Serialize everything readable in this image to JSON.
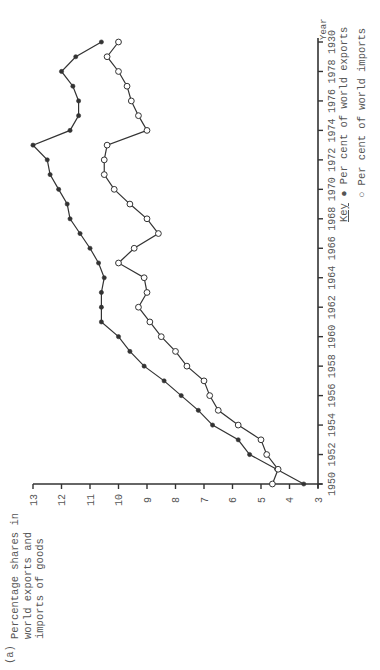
{
  "figure": {
    "panel_label": "(a)",
    "title_lines": [
      "Percentage shares in",
      "world exports and",
      "imports of goods"
    ]
  },
  "legend": {
    "key_word": "Key",
    "exports_marker": "●",
    "exports_label": "Per cent of world exports",
    "imports_marker": "○",
    "imports_label": "Per cent of world imports"
  },
  "axes": {
    "x_title": "Year",
    "x_ticks": [
      "1950",
      "1952",
      "1954",
      "1956",
      "1958",
      "1960",
      "1962",
      "1964",
      "1966",
      "1968",
      "1970",
      "1972",
      "1974",
      "1976",
      "1978",
      "1930"
    ],
    "y_ticks": [
      "3",
      "4",
      "5",
      "6",
      "7",
      "8",
      "9",
      "10",
      "11",
      "12",
      "13"
    ]
  },
  "colors": {
    "line": "#333333",
    "axis": "#333333",
    "text": "#555555"
  },
  "chart_data": {
    "type": "line",
    "title": "Percentage shares in world exports and imports of goods",
    "panel": "(a)",
    "xlabel": "Year",
    "ylabel": "Percentage share",
    "x": [
      1950,
      1951,
      1952,
      1953,
      1954,
      1955,
      1956,
      1957,
      1958,
      1959,
      1960,
      1961,
      1962,
      1963,
      1964,
      1965,
      1966,
      1967,
      1968,
      1969,
      1970,
      1971,
      1972,
      1973,
      1974,
      1975,
      1976,
      1977,
      1978,
      1979,
      1980
    ],
    "x_tick_labels": [
      "1950",
      "1952",
      "1954",
      "1956",
      "1958",
      "1960",
      "1962",
      "1964",
      "1966",
      "1968",
      "1970",
      "1972",
      "1974",
      "1976",
      "1978",
      "1930"
    ],
    "xlim": [
      1950,
      1980
    ],
    "ylim": [
      3,
      13
    ],
    "y_ticks": [
      3,
      4,
      5,
      6,
      7,
      8,
      9,
      10,
      11,
      12,
      13
    ],
    "grid": false,
    "orientation": "rotated 90° counter-clockwise",
    "legend_position": "right (key below year axis end)",
    "series": [
      {
        "name": "Per cent of world exports",
        "marker": "filled circle",
        "values": [
          3.5,
          4.45,
          5.4,
          5.8,
          6.7,
          7.2,
          7.8,
          8.4,
          9.1,
          9.6,
          10.0,
          10.6,
          10.6,
          10.6,
          10.5,
          10.7,
          11.0,
          11.35,
          11.7,
          11.8,
          12.1,
          12.4,
          12.5,
          13.0,
          11.7,
          11.4,
          11.4,
          11.6,
          12.0,
          11.5,
          10.6
        ]
      },
      {
        "name": "Per cent of world imports",
        "marker": "open circle",
        "values": [
          4.6,
          4.4,
          4.8,
          5.0,
          5.8,
          6.5,
          6.8,
          7.0,
          7.6,
          8.0,
          8.5,
          8.9,
          9.3,
          9.0,
          9.1,
          10.0,
          9.45,
          8.6,
          9.0,
          9.6,
          10.15,
          10.5,
          10.5,
          10.4,
          9.0,
          9.3,
          9.55,
          9.7,
          10.0,
          10.4,
          10.0
        ]
      }
    ]
  }
}
